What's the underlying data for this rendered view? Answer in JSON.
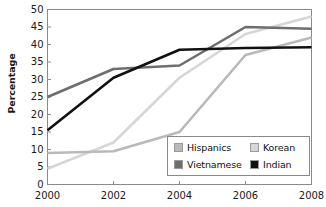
{
  "chart_data": {
    "type": "line",
    "title": "",
    "xlabel": "",
    "ylabel": "Percentage",
    "x": [
      2000,
      2002,
      2004,
      2006,
      2008
    ],
    "xtick_labels": [
      "2000",
      "2002",
      "2004",
      "2006",
      "2008"
    ],
    "ytick_labels": [
      "0",
      "5",
      "10",
      "15",
      "20",
      "25",
      "30",
      "35",
      "40",
      "45",
      "50"
    ],
    "yticks": [
      0,
      5,
      10,
      15,
      20,
      25,
      30,
      35,
      40,
      45,
      50
    ],
    "ylim": [
      0,
      50
    ],
    "xlim": [
      2000,
      2008
    ],
    "grid": false,
    "legend_position": "lower right",
    "series": [
      {
        "name": "Hispanics",
        "color": "#b9b9b9",
        "values": [
          9,
          9.5,
          15,
          37,
          42
        ]
      },
      {
        "name": "Vietnamese",
        "color": "#6e6e6e",
        "values": [
          25,
          33,
          34,
          45,
          44.5
        ]
      },
      {
        "name": "Korean",
        "color": "#d6d6d6",
        "values": [
          4.5,
          12,
          30.5,
          43,
          48
        ]
      },
      {
        "name": "Indian",
        "color": "#111111",
        "values": [
          15.5,
          30.5,
          38.5,
          39,
          39.2
        ]
      }
    ]
  },
  "legend": {
    "items": [
      {
        "label": "Hispanics",
        "color": "#b9b9b9"
      },
      {
        "label": "Korean",
        "color": "#d6d6d6"
      },
      {
        "label": "Vietnamese",
        "color": "#6e6e6e"
      },
      {
        "label": "Indian",
        "color": "#111111"
      }
    ]
  },
  "axes": {
    "frame_color": "#8a8a8a",
    "text_color": "#1a1a1a"
  }
}
